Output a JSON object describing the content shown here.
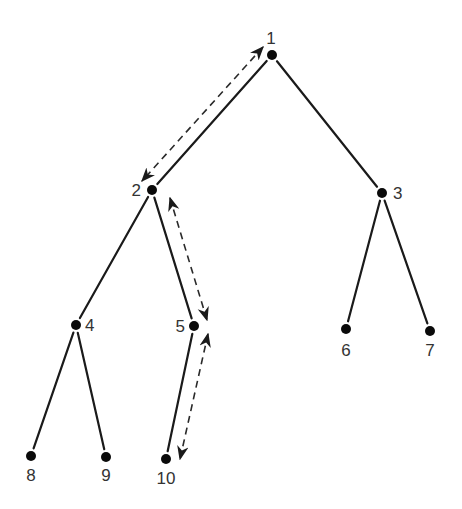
{
  "diagram": {
    "type": "tree",
    "nodes": [
      {
        "id": "1",
        "label": "1",
        "x": 272,
        "y": 55,
        "lx": 271,
        "ly": 44,
        "anchor": "middle"
      },
      {
        "id": "2",
        "label": "2",
        "x": 152,
        "y": 190,
        "lx": 141,
        "ly": 196,
        "anchor": "end"
      },
      {
        "id": "3",
        "label": "3",
        "x": 382,
        "y": 193,
        "lx": 393,
        "ly": 199,
        "anchor": "start"
      },
      {
        "id": "4",
        "label": "4",
        "x": 76,
        "y": 325,
        "lx": 85,
        "ly": 331,
        "anchor": "start"
      },
      {
        "id": "5",
        "label": "5",
        "x": 194,
        "y": 326,
        "lx": 185,
        "ly": 332,
        "anchor": "end"
      },
      {
        "id": "6",
        "label": "6",
        "x": 346,
        "y": 329,
        "lx": 346,
        "ly": 356,
        "anchor": "middle"
      },
      {
        "id": "7",
        "label": "7",
        "x": 430,
        "y": 331,
        "lx": 430,
        "ly": 356,
        "anchor": "middle"
      },
      {
        "id": "8",
        "label": "8",
        "x": 31,
        "y": 456,
        "lx": 31,
        "ly": 481,
        "anchor": "middle"
      },
      {
        "id": "9",
        "label": "9",
        "x": 106,
        "y": 457,
        "lx": 106,
        "ly": 481,
        "anchor": "middle"
      },
      {
        "id": "10",
        "label": "10",
        "x": 166,
        "y": 459,
        "lx": 166,
        "ly": 484,
        "anchor": "middle"
      }
    ],
    "edges": [
      [
        "1",
        "2"
      ],
      [
        "1",
        "3"
      ],
      [
        "2",
        "4"
      ],
      [
        "2",
        "5"
      ],
      [
        "3",
        "6"
      ],
      [
        "3",
        "7"
      ],
      [
        "4",
        "8"
      ],
      [
        "4",
        "9"
      ],
      [
        "5",
        "10"
      ]
    ],
    "traversal_arrows": [
      {
        "from": "1",
        "to": "2",
        "style": "dashed",
        "bidirectional": true,
        "x1": 263,
        "y1": 47,
        "x2": 142,
        "y2": 181
      },
      {
        "from": "2",
        "to": "5",
        "style": "dashed",
        "bidirectional": true,
        "x1": 170,
        "y1": 198,
        "x2": 207,
        "y2": 320
      },
      {
        "from": "5",
        "to": "10",
        "style": "dashed",
        "bidirectional": true,
        "x1": 208,
        "y1": 334,
        "x2": 180,
        "y2": 459
      }
    ],
    "colors": {
      "edge": "#1a1a1a",
      "node": "#0a0a0a",
      "label": "#333333",
      "background": "#ffffff"
    }
  }
}
